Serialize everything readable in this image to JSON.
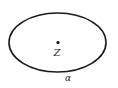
{
  "diagram": {
    "shape": "ellipse",
    "center_point_label": "Z",
    "boundary_label": "α",
    "colors": {
      "stroke": "#1a1a1a",
      "background": "#ffffff"
    }
  }
}
